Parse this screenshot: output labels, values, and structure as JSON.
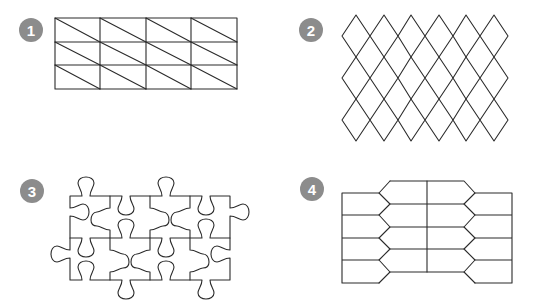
{
  "panels": [
    {
      "id": 1,
      "label": "1",
      "description": "Rectangle grid with diagonals (triangular tessellation)",
      "badge": {
        "cx": 31,
        "cy": 30
      }
    },
    {
      "id": 2,
      "label": "2",
      "description": "Rhombus (diamond) tessellation",
      "badge": {
        "cx": 311,
        "cy": 30
      }
    },
    {
      "id": 3,
      "label": "3",
      "description": "Jigsaw puzzle piece tessellation",
      "badge": {
        "cx": 32,
        "cy": 191
      }
    },
    {
      "id": 4,
      "label": "4",
      "description": "Elongated hexagon / arrow-shaped tessellation",
      "badge": {
        "cx": 312,
        "cy": 189
      }
    }
  ],
  "colors": {
    "badge": "#8c8c8c",
    "stroke": "#2b2b2b",
    "background": "#ffffff"
  }
}
